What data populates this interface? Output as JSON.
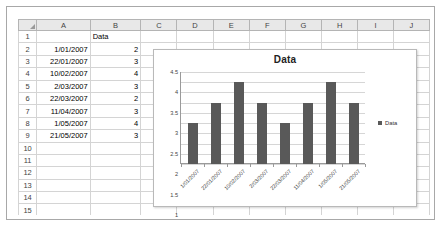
{
  "spreadsheet": {
    "column_headers": [
      "A",
      "B",
      "C",
      "D",
      "E",
      "F",
      "G",
      "H",
      "I",
      "J"
    ],
    "row_numbers": [
      "1",
      "2",
      "3",
      "4",
      "5",
      "6",
      "7",
      "8",
      "9",
      "10",
      "11",
      "12",
      "13",
      "14",
      "15",
      "16"
    ],
    "header_cell_b1": "Data",
    "rows": [
      {
        "row": "2",
        "a": "1/01/2007",
        "b": "2"
      },
      {
        "row": "3",
        "a": "22/01/2007",
        "b": "3"
      },
      {
        "row": "4",
        "a": "10/02/2007",
        "b": "4"
      },
      {
        "row": "5",
        "a": "2/03/2007",
        "b": "3"
      },
      {
        "row": "6",
        "a": "22/03/2007",
        "b": "2"
      },
      {
        "row": "7",
        "a": "11/04/2007",
        "b": "3"
      },
      {
        "row": "8",
        "a": "1/05/2007",
        "b": "4"
      },
      {
        "row": "9",
        "a": "21/05/2007",
        "b": "3"
      }
    ]
  },
  "chart_data": {
    "type": "bar",
    "title": "Data",
    "categories": [
      "1/01/2007",
      "22/01/2007",
      "10/02/2007",
      "2/03/2007",
      "22/03/2007",
      "11/04/2007",
      "1/05/2007",
      "21/05/2007"
    ],
    "values": [
      2,
      3,
      4,
      3,
      2,
      3,
      4,
      3
    ],
    "series": [
      {
        "name": "Data",
        "values": [
          2,
          3,
          4,
          3,
          2,
          3,
          4,
          3
        ]
      }
    ],
    "xlabel": "",
    "ylabel": "",
    "ylim": [
      0,
      4.5
    ],
    "yticks": [
      "0",
      "0.5",
      "1",
      "1.5",
      "2",
      "2.5",
      "3",
      "3.5",
      "4",
      "4.5"
    ],
    "grid": true,
    "legend": {
      "position": "right",
      "entries": [
        "Data"
      ]
    },
    "bar_color": "#595959"
  }
}
